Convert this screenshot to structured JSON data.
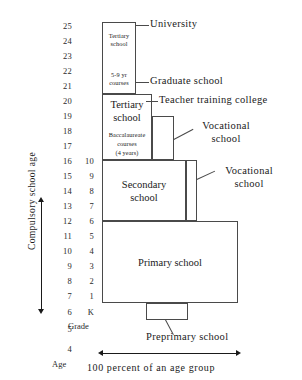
{
  "diagram": {
    "type": "education-system-ladder"
  },
  "axes": {
    "age_caption": "Age",
    "grade_caption": "Grade",
    "age_ticks": [
      "25",
      "24",
      "23",
      "22",
      "21",
      "20",
      "19",
      "18",
      "17",
      "16",
      "15",
      "14",
      "13",
      "12",
      "11",
      "10",
      "9",
      "8",
      "7",
      "6",
      "5",
      "4"
    ],
    "grade_ticks": [
      "10",
      "9",
      "8",
      "7",
      "6",
      "5",
      "4",
      "3",
      "2",
      "1",
      "K"
    ],
    "compulsory_label": "Compulsory school age",
    "bottom_caption": "100 percent of an age group"
  },
  "boxes": {
    "tertiary_upper": {
      "line1": "Tertiary",
      "line2": "school",
      "line3": "5-9 yr",
      "line4": "courses"
    },
    "tertiary_lower": {
      "line1": "Tertiary",
      "line2": "school",
      "line3": "Baccalaureate",
      "line4": "courses",
      "line5": "(4 years)"
    },
    "secondary": {
      "line1": "Secondary",
      "line2": "school"
    },
    "primary": {
      "label": "Primary school"
    },
    "preprimary": {
      "label": ""
    },
    "vocational_upper": {
      "label": ""
    },
    "vocational_lower": {
      "label": ""
    }
  },
  "callouts": {
    "university": "University",
    "graduate_school": "Graduate school",
    "teacher_training": "Teacher training college",
    "vocational_upper_l1": "Vocational",
    "vocational_upper_l2": "school",
    "vocational_lower_l1": "Vocational",
    "vocational_lower_l2": "school",
    "preprimary": "Preprimary school"
  },
  "colors": {
    "stroke": "#4a4a4a",
    "text": "#1a1a1a",
    "background": "#ffffff"
  }
}
